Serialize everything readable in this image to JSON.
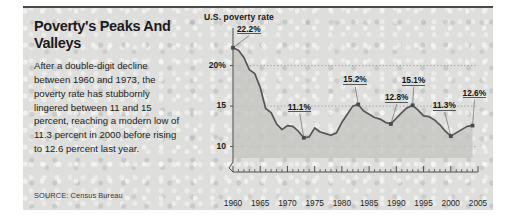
{
  "panel": {
    "headline": "Poverty's Peaks And Valleys",
    "deck": "After a double-digit decline between 1960 and 1973, the poverty rate has stubbornly lingered between 11 and 15 percent, reaching a modern low of 11.3 percent in 2000 before rising to 12.6 percent last year.",
    "source": "SOURCE: Census Bureau"
  },
  "colors": {
    "panel_bg": "#dededc",
    "rule": "#4a4a48",
    "line": "#55555a",
    "area_fill": "#c4c4c2",
    "grid": "#8e8e8c",
    "text": "#1b1b1a"
  },
  "chart_data": {
    "type": "area",
    "title": "U.S. poverty rate",
    "xlabel": "",
    "ylabel": "",
    "grid": true,
    "legend_position": "none",
    "xlim": [
      1960,
      2005
    ],
    "ylim": [
      8.6,
      23.4
    ],
    "ytick_labels": [
      "20%",
      "15",
      "10"
    ],
    "ytick_values": [
      20,
      15,
      10
    ],
    "xtick_labels": [
      "1960",
      "1965",
      "1970",
      "1975",
      "1980",
      "1985",
      "1990",
      "1995",
      "2000",
      "2005"
    ],
    "xtick_values": [
      1960,
      1965,
      1970,
      1975,
      1980,
      1985,
      1990,
      1995,
      2000,
      2005
    ],
    "minor_xticks_every": 1,
    "x": [
      1960,
      1961,
      1962,
      1963,
      1964,
      1965,
      1966,
      1967,
      1968,
      1969,
      1970,
      1971,
      1972,
      1973,
      1974,
      1975,
      1976,
      1977,
      1978,
      1979,
      1980,
      1981,
      1982,
      1983,
      1984,
      1985,
      1986,
      1987,
      1988,
      1989,
      1990,
      1991,
      1992,
      1993,
      1994,
      1995,
      1996,
      1997,
      1998,
      1999,
      2000,
      2001,
      2002,
      2003,
      2004
    ],
    "values": [
      22.2,
      21.9,
      21.0,
      19.5,
      19.0,
      17.3,
      14.7,
      14.2,
      12.8,
      12.1,
      12.6,
      12.5,
      11.9,
      11.1,
      11.2,
      12.3,
      11.8,
      11.6,
      11.4,
      11.7,
      13.0,
      14.0,
      15.0,
      15.2,
      14.4,
      14.0,
      13.6,
      13.4,
      13.0,
      12.8,
      13.5,
      14.2,
      14.8,
      15.1,
      14.5,
      13.8,
      13.7,
      13.3,
      12.7,
      11.9,
      11.3,
      11.7,
      12.1,
      12.5,
      12.6
    ],
    "annotations": [
      {
        "label": "22.2%",
        "year": 1960,
        "value": 22.2
      },
      {
        "label": "11.1%",
        "year": 1973,
        "value": 11.1
      },
      {
        "label": "15.2%",
        "year": 1983,
        "value": 15.2
      },
      {
        "label": "12.8%",
        "year": 1989,
        "value": 12.8
      },
      {
        "label": "15.1%",
        "year": 1993,
        "value": 15.1
      },
      {
        "label": "11.3%",
        "year": 2000,
        "value": 11.3
      },
      {
        "label": "12.6%",
        "year": 2004,
        "value": 12.6
      }
    ]
  }
}
